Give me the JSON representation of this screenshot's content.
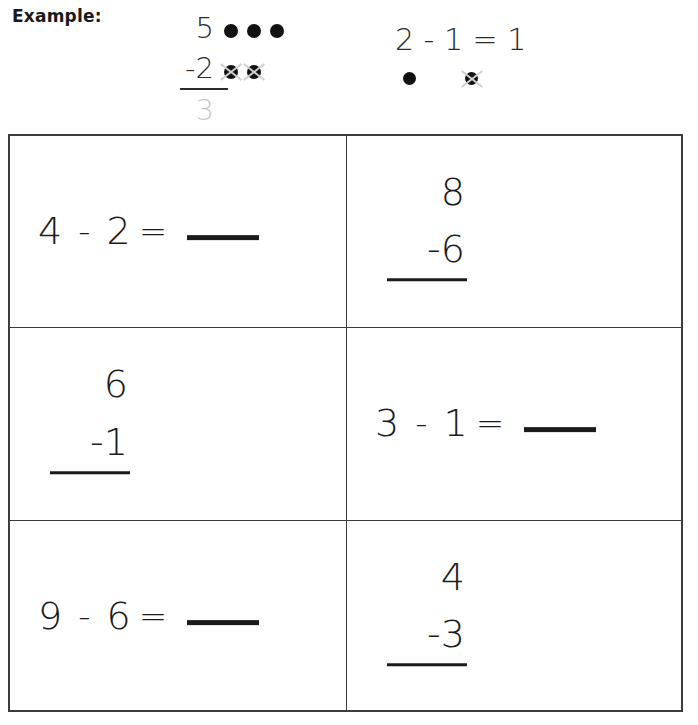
{
  "example": {
    "label": "Example:",
    "vertical": {
      "minuend": "5",
      "subtrahend": "-2",
      "answer": "3",
      "top_dots": 3,
      "crossed_dots": 2
    },
    "horizontal": {
      "equation": "2 - 1 = 1",
      "minuend": "2",
      "operator": "-",
      "subtrahend": "1",
      "equals": "=",
      "answer": "1",
      "dots": 1,
      "crossed_dots": 1
    }
  },
  "colors": {
    "ink": "#1b1b1b",
    "faded_answer": "#c9c9c9",
    "cross_mark": "#cfcfcf",
    "grid_border": "#3c3c3c"
  },
  "problems": [
    {
      "index": 1,
      "format": "horizontal",
      "minuend": "4",
      "operator": "-",
      "subtrahend": "2",
      "equals": "=",
      "answer": ""
    },
    {
      "index": 2,
      "format": "vertical",
      "minuend": "8",
      "subtrahend": "-6",
      "answer": ""
    },
    {
      "index": 3,
      "format": "vertical",
      "minuend": "6",
      "subtrahend": "-1",
      "answer": ""
    },
    {
      "index": 4,
      "format": "horizontal",
      "minuend": "3",
      "operator": "-",
      "subtrahend": "1",
      "equals": "=",
      "answer": ""
    },
    {
      "index": 5,
      "format": "horizontal",
      "minuend": "9",
      "operator": "-",
      "subtrahend": "6",
      "equals": "=",
      "answer": ""
    },
    {
      "index": 6,
      "format": "vertical",
      "minuend": "4",
      "subtrahend": "-3",
      "answer": ""
    }
  ]
}
